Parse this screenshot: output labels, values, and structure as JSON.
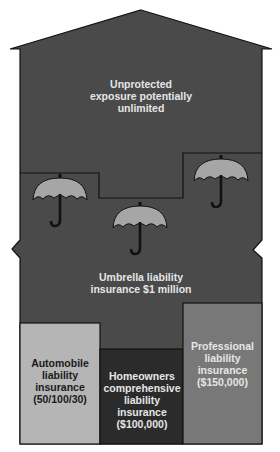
{
  "diagram": {
    "colors": {
      "house": "#4a4a4a",
      "outline": "#111111",
      "umbrella_canopy": "#a6a6a6",
      "automobile_box": "#b5b5b5",
      "homeowners_box": "#2b2b2b",
      "professional_box": "#787878",
      "light_text": "#e6e6e6",
      "dark_text": "#1a1a1a"
    },
    "regions": {
      "unprotected": {
        "lines": [
          "Unprotected",
          "exposure potentially",
          "unlimited"
        ]
      },
      "umbrella": {
        "lines": [
          "Umbrella liability",
          "insurance $1 million"
        ],
        "icon": "umbrella-icon",
        "icon_count": 3
      },
      "automobile": {
        "lines": [
          "Automobile",
          "liability",
          "insurance",
          "(50/100/30)"
        ]
      },
      "homeowners": {
        "lines": [
          "Homeowners",
          "comprehensive",
          "liability",
          "insurance",
          "($100,000)"
        ]
      },
      "professional": {
        "lines": [
          "Professional",
          "liability",
          "insurance",
          "($150,000)"
        ]
      }
    }
  }
}
